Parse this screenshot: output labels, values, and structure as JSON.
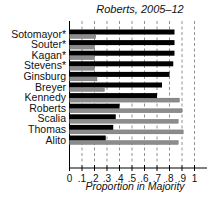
{
  "chart_data": {
    "type": "bar",
    "orientation": "horizontal",
    "title": "Roberts, 2005–12",
    "xlabel": "Proportion in Majority",
    "ylabel": "",
    "xlim": [
      0,
      1
    ],
    "xticks": [
      "0",
      ".1",
      ".2",
      ".3",
      ".4",
      ".5",
      ".6",
      ".7",
      ".8",
      ".9",
      "1"
    ],
    "grid": "vertical dashed",
    "legend": null,
    "categories": [
      "Sotomayor*",
      "Souter*",
      "Kagan*",
      "Stevens*",
      "Ginsburg",
      "Breyer",
      "Kennedy",
      "Roberts",
      "Scalia",
      "Thomas",
      "Alito"
    ],
    "series": [
      {
        "name": "black bar",
        "color": "#000000",
        "values": [
          0.84,
          0.84,
          0.84,
          0.83,
          0.8,
          0.74,
          0.7,
          0.4,
          0.37,
          0.35,
          0.29
        ]
      },
      {
        "name": "gray bar",
        "color": "#8c8c8c",
        "values": [
          0.21,
          0.2,
          0.2,
          0.2,
          0.22,
          0.28,
          0.88,
          0.9,
          0.87,
          0.91,
          0.87
        ]
      }
    ]
  }
}
